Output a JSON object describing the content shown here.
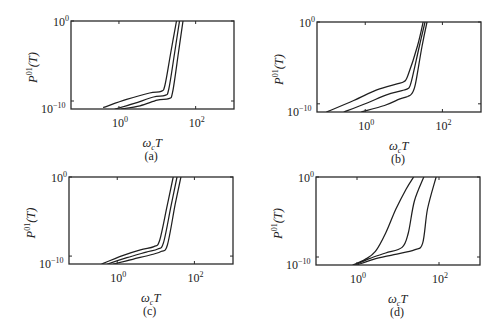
{
  "figure": {
    "panel_labels": [
      "(a)",
      "(b)",
      "(c)",
      "(d)"
    ]
  },
  "chart_data": [
    {
      "type": "line",
      "panel": "(a)",
      "xscale": "log",
      "yscale": "log",
      "xlabel": "ω_c T",
      "ylabel": "P^01(T)",
      "xlim_log10": [
        -1.25,
        3.0
      ],
      "ylim_log10": [
        -11,
        0
      ],
      "x_ticks": [
        {
          "exp": "0",
          "log10": 0
        },
        {
          "exp": "2",
          "log10": 2
        }
      ],
      "y_ticks": [
        {
          "exp": "0",
          "log10": 0
        },
        {
          "exp": "−10",
          "log10": -10
        }
      ],
      "grid": false,
      "series": [
        {
          "name": "curve-1",
          "log10_x": [
            -0.4,
            0.2,
            0.8,
            1.1,
            1.2,
            1.35,
            1.5
          ],
          "log10_y": [
            -10.8,
            -9.8,
            -9.0,
            -8.8,
            -8.0,
            -4.0,
            0
          ]
        },
        {
          "name": "curve-2",
          "log10_x": [
            -0.1,
            0.4,
            0.9,
            1.2,
            1.3,
            1.45,
            1.58
          ],
          "log10_y": [
            -11,
            -10.3,
            -9.5,
            -9.3,
            -8.5,
            -4.0,
            0
          ]
        },
        {
          "name": "curve-3",
          "log10_x": [
            0.05,
            0.55,
            1.0,
            1.3,
            1.4,
            1.55,
            1.67
          ],
          "log10_y": [
            -11,
            -10.6,
            -9.9,
            -9.7,
            -8.9,
            -4.0,
            0
          ]
        }
      ]
    },
    {
      "type": "line",
      "panel": "(b)",
      "xscale": "log",
      "yscale": "log",
      "xlabel": "ω_c T",
      "ylabel": "P^01(T)",
      "xlim_log10": [
        -1.25,
        3.0
      ],
      "ylim_log10": [
        -11,
        0
      ],
      "x_ticks": [
        {
          "exp": "0",
          "log10": 0
        },
        {
          "exp": "2",
          "log10": 2
        }
      ],
      "y_ticks": [
        {
          "exp": "0",
          "log10": 0
        },
        {
          "exp": "−10",
          "log10": -10
        }
      ],
      "grid": false,
      "series": [
        {
          "name": "curve-1",
          "log10_x": [
            -1.0,
            -0.3,
            0.3,
            0.8,
            1.0,
            1.1,
            1.35,
            1.5
          ],
          "log10_y": [
            -11,
            -9.6,
            -8.3,
            -7.6,
            -7.3,
            -6.6,
            -3.0,
            0
          ]
        },
        {
          "name": "curve-2",
          "log10_x": [
            -0.55,
            0.05,
            0.55,
            0.95,
            1.12,
            1.2,
            1.4,
            1.55
          ],
          "log10_y": [
            -11,
            -9.9,
            -8.9,
            -8.4,
            -8.1,
            -7.2,
            -3.0,
            0
          ]
        },
        {
          "name": "curve-3",
          "log10_x": [
            -0.1,
            0.5,
            0.9,
            1.1,
            1.2,
            1.3,
            1.47,
            1.6
          ],
          "log10_y": [
            -11,
            -10.2,
            -9.4,
            -9.1,
            -8.8,
            -7.6,
            -3.0,
            0
          ]
        }
      ]
    },
    {
      "type": "line",
      "panel": "(c)",
      "xscale": "log",
      "yscale": "log",
      "xlabel": "ω_c T",
      "ylabel": "P^01(T)",
      "xlim_log10": [
        -1.25,
        3.0
      ],
      "ylim_log10": [
        -11,
        0
      ],
      "x_ticks": [
        {
          "exp": "0",
          "log10": 0
        },
        {
          "exp": "2",
          "log10": 2
        }
      ],
      "y_ticks": [
        {
          "exp": "0",
          "log10": 0
        },
        {
          "exp": "−10",
          "log10": -10
        }
      ],
      "grid": false,
      "series": [
        {
          "name": "curve-1",
          "log10_x": [
            -0.4,
            0.1,
            0.6,
            0.95,
            1.1,
            1.3,
            1.45
          ],
          "log10_y": [
            -11,
            -10.0,
            -9.2,
            -8.8,
            -8.0,
            -3.5,
            0
          ]
        },
        {
          "name": "curve-2",
          "log10_x": [
            -0.25,
            0.25,
            0.75,
            1.05,
            1.2,
            1.4,
            1.55
          ],
          "log10_y": [
            -11,
            -10.2,
            -9.5,
            -9.1,
            -8.3,
            -3.5,
            0
          ]
        },
        {
          "name": "curve-3",
          "log10_x": [
            -0.1,
            0.4,
            0.9,
            1.15,
            1.3,
            1.5,
            1.65
          ],
          "log10_y": [
            -11,
            -10.4,
            -9.8,
            -9.4,
            -8.6,
            -3.5,
            0
          ]
        }
      ]
    },
    {
      "type": "line",
      "panel": "(d)",
      "xscale": "log",
      "yscale": "log",
      "xlabel": "ω_c T",
      "ylabel": "P^01(T)",
      "xlim_log10": [
        -1.0,
        3.0
      ],
      "ylim_log10": [
        -11,
        0
      ],
      "x_ticks": [
        {
          "exp": "0",
          "log10": 0
        },
        {
          "exp": "2",
          "log10": 2
        }
      ],
      "y_ticks": [
        {
          "exp": "0",
          "log10": 0
        },
        {
          "exp": "−10",
          "log10": -10
        }
      ],
      "grid": false,
      "series": [
        {
          "name": "curve-1",
          "log10_x": [
            -0.1,
            0.2,
            0.45,
            0.7,
            0.95,
            1.2,
            1.38
          ],
          "log10_y": [
            -11,
            -10.3,
            -9.3,
            -7.0,
            -4.0,
            -1.5,
            0
          ]
        },
        {
          "name": "curve-2",
          "log10_x": [
            -0.05,
            0.3,
            0.7,
            1.1,
            1.25,
            1.4,
            1.63
          ],
          "log10_y": [
            -11,
            -10.2,
            -9.5,
            -8.8,
            -7.0,
            -3.0,
            0
          ]
        },
        {
          "name": "curve-3",
          "log10_x": [
            0.0,
            0.4,
            0.9,
            1.4,
            1.6,
            1.72,
            1.93
          ],
          "log10_y": [
            -11,
            -10.3,
            -9.7,
            -9.1,
            -8.3,
            -4.0,
            0
          ]
        }
      ]
    }
  ]
}
